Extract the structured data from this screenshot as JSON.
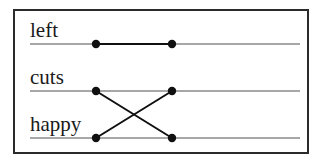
{
  "figure": {
    "frame": {
      "x": 13,
      "y": 9,
      "width": 296,
      "height": 145,
      "border_color": "#2b2b2b",
      "border_width": 2,
      "background": "#ffffff"
    },
    "colors": {
      "tier_line": "#8a8a8a",
      "association_line": "#101010",
      "node_fill": "#101010",
      "text": "#1a1a1a",
      "frame": "#2b2b2b",
      "background": "#ffffff"
    },
    "geometry": {
      "tier_line_x_start": 30,
      "tier_line_x_end": 300,
      "node_left_x": 96,
      "node_right_x": 172,
      "node_radius": 4.2,
      "tier_line_width": 1.6,
      "association_line_width": 2.0
    }
  },
  "tiers": [
    {
      "id": "tier-left",
      "label": "left",
      "y": 44,
      "label_x": 30,
      "label_y": 20
    },
    {
      "id": "tier-cuts",
      "label": "cuts",
      "y": 91,
      "label_x": 30,
      "label_y": 67
    },
    {
      "id": "tier-happy",
      "label": "happy",
      "y": 138,
      "label_x": 30,
      "label_y": 114
    }
  ],
  "nodes": [
    {
      "id": "node-left-a",
      "tier": "left",
      "side": "left",
      "x": 96,
      "y": 44
    },
    {
      "id": "node-left-b",
      "tier": "left",
      "side": "right",
      "x": 172,
      "y": 44
    },
    {
      "id": "node-cuts-a",
      "tier": "cuts",
      "side": "left",
      "x": 96,
      "y": 91
    },
    {
      "id": "node-cuts-b",
      "tier": "cuts",
      "side": "right",
      "x": 172,
      "y": 91
    },
    {
      "id": "node-happy-a",
      "tier": "happy",
      "side": "left",
      "x": 96,
      "y": 138
    },
    {
      "id": "node-happy-b",
      "tier": "happy",
      "side": "right",
      "x": 172,
      "y": 138
    }
  ],
  "connections": [
    {
      "id": "conn-left-straight",
      "kind": "straight",
      "from": "node-left-a",
      "to": "node-left-b",
      "x1": 96,
      "y1": 44,
      "x2": 172,
      "y2": 44
    },
    {
      "id": "conn-cuts-to-happy",
      "kind": "crossing",
      "from": "node-cuts-a",
      "to": "node-happy-b",
      "x1": 96,
      "y1": 91,
      "x2": 172,
      "y2": 138
    },
    {
      "id": "conn-happy-to-cuts",
      "kind": "crossing",
      "from": "node-happy-a",
      "to": "node-cuts-b",
      "x1": 96,
      "y1": 138,
      "x2": 172,
      "y2": 91
    }
  ],
  "tier_segments": [
    {
      "id": "seg-left",
      "y": 44,
      "x1": 30,
      "x2": 300
    },
    {
      "id": "seg-cuts",
      "y": 91,
      "x1": 30,
      "x2": 300
    },
    {
      "id": "seg-happy",
      "y": 138,
      "x1": 30,
      "x2": 300
    }
  ]
}
